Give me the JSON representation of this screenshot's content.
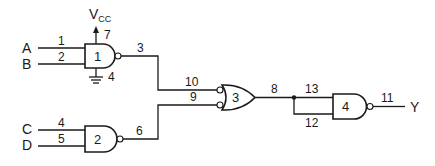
{
  "diagram": {
    "inputs": [
      {
        "name": "A",
        "pin": "1"
      },
      {
        "name": "B",
        "pin": "2"
      },
      {
        "name": "C",
        "pin": "4"
      },
      {
        "name": "D",
        "pin": "5"
      }
    ],
    "output": {
      "name": "Y",
      "pin": "11"
    },
    "power": {
      "label": "V",
      "sub": "CC",
      "pin": "7"
    },
    "ground": {
      "pin": "4"
    },
    "gates": [
      {
        "id": "1",
        "type": "NAND",
        "inputs": [
          "1",
          "2"
        ],
        "output": "3"
      },
      {
        "id": "2",
        "type": "NAND",
        "inputs": [
          "4",
          "5"
        ],
        "output": "6"
      },
      {
        "id": "3",
        "type": "OR (inverted inputs)",
        "inputs": [
          "10",
          "9"
        ],
        "output": "8"
      },
      {
        "id": "4",
        "type": "NAND",
        "inputs": [
          "13",
          "12"
        ],
        "output": "11"
      }
    ]
  },
  "labels": {
    "A": "A",
    "B": "B",
    "C": "C",
    "D": "D",
    "Y": "Y",
    "vcc": "V",
    "vcc_sub": "CC",
    "p1": "1",
    "p2": "2",
    "p3": "3",
    "p4_gnd": "4",
    "p7": "7",
    "p4": "4",
    "p5": "5",
    "p6": "6",
    "p10": "10",
    "p9": "9",
    "p8": "8",
    "p13": "13",
    "p12": "12",
    "p11": "11",
    "g1": "1",
    "g2": "2",
    "g3": "3",
    "g4": "4"
  }
}
